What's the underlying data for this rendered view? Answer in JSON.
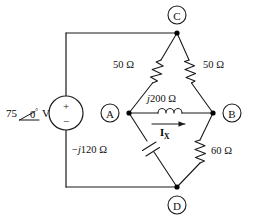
{
  "figure": {
    "kind": "ac-bridge-circuit-schematic",
    "background_color": "#ffffff",
    "line_color": "#1a1a1a"
  },
  "source": {
    "name": "voltage-source",
    "magnitude": "75",
    "angle": "0",
    "degree_symbol": "°",
    "unit": "V",
    "plus_sign": "+",
    "minus_sign": "−",
    "full_label": "75 ∠0° V"
  },
  "nodes": [
    {
      "id": "C",
      "label": "C",
      "position": "top"
    },
    {
      "id": "A",
      "label": "A",
      "position": "left-center"
    },
    {
      "id": "B",
      "label": "B",
      "position": "right-center"
    },
    {
      "id": "D",
      "label": "D",
      "position": "bottom"
    }
  ],
  "components": [
    {
      "id": "r-top-left",
      "type": "resistor",
      "label": "50 Ω",
      "value": "50",
      "unit": "Ω",
      "between": [
        "A",
        "C"
      ]
    },
    {
      "id": "r-top-right",
      "type": "resistor",
      "label": "50 Ω",
      "value": "50",
      "unit": "Ω",
      "between": [
        "C",
        "B"
      ]
    },
    {
      "id": "l-center",
      "type": "inductor",
      "label": "j200 Ω",
      "value_italic_j": "j",
      "value_rest": "200 Ω",
      "between": [
        "A",
        "B"
      ]
    },
    {
      "id": "c-bottom-left",
      "type": "capacitor",
      "label": "−j120 Ω",
      "value_sign_j": "−j",
      "value_rest": "120 Ω",
      "between": [
        "A",
        "D"
      ]
    },
    {
      "id": "r-bottom-right",
      "type": "resistor",
      "label": "60 Ω",
      "value": "60",
      "unit": "Ω",
      "between": [
        "B",
        "D"
      ]
    }
  ],
  "current": {
    "id": "current-ix",
    "symbol": "I",
    "subscript": "X",
    "label": "I_X",
    "direction": "A-to-B",
    "arrow": "right"
  }
}
